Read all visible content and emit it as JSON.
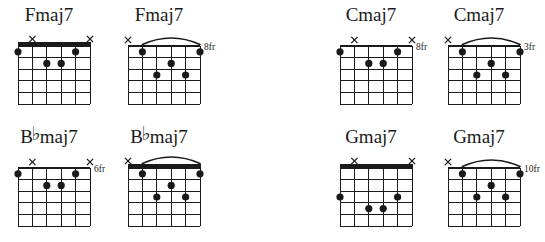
{
  "page": {
    "background_color": "#ffffff",
    "ink_color": "#1a1a1a",
    "strings": 6,
    "frets": 5
  },
  "legend": {
    "muted_marker": "×",
    "flat_symbol": "♭",
    "dot_marker": "filled-dot",
    "barre_marker": "arc"
  },
  "chords": [
    {
      "id": "fmaj7-open",
      "name": "Fmaj7",
      "name_prefix": "Fmaj7",
      "accidental": "",
      "name_suffix": "",
      "fret_label": "",
      "nut": "thick",
      "barre": false,
      "muted_strings": [
        5,
        1
      ],
      "open_strings": [],
      "dots": [
        {
          "string": 6,
          "fret": 1
        },
        {
          "string": 4,
          "fret": 2
        },
        {
          "string": 3,
          "fret": 2
        },
        {
          "string": 2,
          "fret": 1
        }
      ]
    },
    {
      "id": "fmaj7-8fr",
      "name": "Fmaj7",
      "name_prefix": "Fmaj7",
      "accidental": "",
      "name_suffix": "",
      "fret_label": "8fr",
      "nut": "thin",
      "barre": true,
      "muted_strings": [
        6
      ],
      "open_strings": [],
      "dots": [
        {
          "string": 5,
          "fret": 1
        },
        {
          "string": 1,
          "fret": 1
        },
        {
          "string": 3,
          "fret": 2
        },
        {
          "string": 4,
          "fret": 3
        },
        {
          "string": 2,
          "fret": 3
        }
      ]
    },
    {
      "id": "cmaj7-8fr",
      "name": "Cmaj7",
      "name_prefix": "Cmaj7",
      "accidental": "",
      "name_suffix": "",
      "fret_label": "8fr",
      "nut": "thin",
      "barre": false,
      "muted_strings": [
        5,
        1
      ],
      "open_strings": [],
      "dots": [
        {
          "string": 6,
          "fret": 1
        },
        {
          "string": 4,
          "fret": 2
        },
        {
          "string": 3,
          "fret": 2
        },
        {
          "string": 2,
          "fret": 1
        }
      ]
    },
    {
      "id": "cmaj7-3fr",
      "name": "Cmaj7",
      "name_prefix": "Cmaj7",
      "accidental": "",
      "name_suffix": "",
      "fret_label": "3fr",
      "nut": "thin",
      "barre": true,
      "muted_strings": [
        6
      ],
      "open_strings": [],
      "dots": [
        {
          "string": 5,
          "fret": 1
        },
        {
          "string": 1,
          "fret": 1
        },
        {
          "string": 3,
          "fret": 2
        },
        {
          "string": 4,
          "fret": 3
        },
        {
          "string": 2,
          "fret": 3
        }
      ]
    },
    {
      "id": "bbmaj7-6fr",
      "name": "B♭maj7",
      "name_prefix": "B",
      "accidental": "♭",
      "name_suffix": "maj7",
      "fret_label": "6fr",
      "nut": "thin",
      "barre": false,
      "muted_strings": [
        5,
        1
      ],
      "open_strings": [],
      "dots": [
        {
          "string": 6,
          "fret": 1
        },
        {
          "string": 4,
          "fret": 2
        },
        {
          "string": 3,
          "fret": 2
        },
        {
          "string": 2,
          "fret": 1
        }
      ]
    },
    {
      "id": "bbmaj7-open",
      "name": "B♭maj7",
      "name_prefix": "B",
      "accidental": "♭",
      "name_suffix": "maj7",
      "fret_label": "",
      "nut": "thick",
      "barre": true,
      "muted_strings": [
        6
      ],
      "open_strings": [],
      "dots": [
        {
          "string": 5,
          "fret": 1
        },
        {
          "string": 1,
          "fret": 1
        },
        {
          "string": 3,
          "fret": 2
        },
        {
          "string": 4,
          "fret": 3
        },
        {
          "string": 2,
          "fret": 3
        }
      ]
    },
    {
      "id": "gmaj7-open",
      "name": "Gmaj7",
      "name_prefix": "Gmaj7",
      "accidental": "",
      "name_suffix": "",
      "fret_label": "",
      "nut": "thick",
      "barre": false,
      "muted_strings": [
        5,
        1
      ],
      "open_strings": [],
      "dots": [
        {
          "string": 6,
          "fret": 3
        },
        {
          "string": 2,
          "fret": 3
        },
        {
          "string": 4,
          "fret": 4
        },
        {
          "string": 3,
          "fret": 4
        }
      ]
    },
    {
      "id": "gmaj7-10fr",
      "name": "Gmaj7",
      "name_prefix": "Gmaj7",
      "accidental": "",
      "name_suffix": "",
      "fret_label": "10fr",
      "nut": "thin",
      "barre": true,
      "muted_strings": [
        6
      ],
      "open_strings": [],
      "dots": [
        {
          "string": 5,
          "fret": 1
        },
        {
          "string": 1,
          "fret": 1
        },
        {
          "string": 3,
          "fret": 2
        },
        {
          "string": 4,
          "fret": 3
        },
        {
          "string": 2,
          "fret": 3
        }
      ]
    }
  ],
  "layout": {
    "positions": [
      {
        "left": 8,
        "top": 4
      },
      {
        "left": 118,
        "top": 4
      },
      {
        "left": 330,
        "top": 4
      },
      {
        "left": 438,
        "top": 4
      },
      {
        "left": 8,
        "top": 126
      },
      {
        "left": 118,
        "top": 126
      },
      {
        "left": 330,
        "top": 126
      },
      {
        "left": 438,
        "top": 126
      }
    ]
  }
}
